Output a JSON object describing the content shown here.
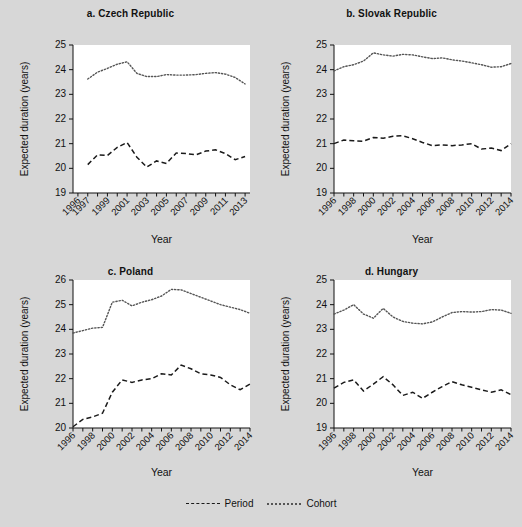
{
  "figure": {
    "background": "#d7d7d7",
    "legend": {
      "position": "bottom-center",
      "items": [
        {
          "label": "Period",
          "style": "dashed",
          "color": "#1a1a1a"
        },
        {
          "label": "Cohort",
          "style": "dotted",
          "color": "#555555"
        }
      ]
    }
  },
  "chart_data": [
    {
      "type": "line",
      "panel": "a",
      "title": "a. Czech Republic",
      "xlabel": "Year",
      "ylabel": "Expected duration (years)",
      "xlim": [
        1995.5,
        2013.5
      ],
      "ylim": [
        19,
        25
      ],
      "yticks": [
        19,
        20,
        21,
        22,
        23,
        24,
        25
      ],
      "xticks": [
        1996,
        1997,
        1999,
        2001,
        2003,
        2005,
        2007,
        2009,
        2011,
        2013
      ],
      "x": [
        1997,
        1998,
        1999,
        2000,
        2001,
        2002,
        2003,
        2004,
        2005,
        2006,
        2007,
        2008,
        2009,
        2010,
        2011,
        2012,
        2013
      ],
      "series": [
        {
          "name": "Period",
          "style": "dashed",
          "values": [
            20.15,
            20.55,
            20.52,
            20.85,
            21.05,
            20.45,
            20.05,
            20.3,
            20.2,
            20.62,
            20.6,
            20.55,
            20.7,
            20.75,
            20.6,
            20.35,
            20.48
          ]
        },
        {
          "name": "Cohort",
          "style": "dotted",
          "values": [
            23.62,
            23.9,
            24.05,
            24.22,
            24.32,
            23.85,
            23.72,
            23.72,
            23.8,
            23.78,
            23.78,
            23.8,
            23.85,
            23.88,
            23.82,
            23.68,
            23.42
          ]
        }
      ],
      "grid": false
    },
    {
      "type": "line",
      "panel": "b",
      "title": "b. Slovak Republic",
      "xlabel": "Year",
      "ylabel": "Expected duration (years)",
      "xlim": [
        1996,
        2014
      ],
      "ylim": [
        19,
        25
      ],
      "yticks": [
        19,
        20,
        21,
        22,
        23,
        24,
        25
      ],
      "xticks": [
        1996,
        1998,
        2000,
        2002,
        2004,
        2006,
        2008,
        2010,
        2012,
        2014
      ],
      "x": [
        1996,
        1997,
        1998,
        1999,
        2000,
        2001,
        2002,
        2003,
        2004,
        2005,
        2006,
        2007,
        2008,
        2009,
        2010,
        2011,
        2012,
        2013,
        2014
      ],
      "series": [
        {
          "name": "Period",
          "style": "dashed",
          "values": [
            21.0,
            21.15,
            21.12,
            21.1,
            21.25,
            21.22,
            21.3,
            21.32,
            21.2,
            21.05,
            20.92,
            20.95,
            20.92,
            20.95,
            21.0,
            20.78,
            20.82,
            20.72,
            21.0
          ]
        },
        {
          "name": "Cohort",
          "style": "dotted",
          "values": [
            23.95,
            24.12,
            24.2,
            24.35,
            24.68,
            24.6,
            24.55,
            24.62,
            24.6,
            24.52,
            24.45,
            24.48,
            24.4,
            24.35,
            24.28,
            24.2,
            24.1,
            24.12,
            24.25
          ]
        }
      ],
      "grid": false
    },
    {
      "type": "line",
      "panel": "c",
      "title": "c. Poland",
      "xlabel": "Year",
      "ylabel": "Expected duration (years)",
      "xlim": [
        1996,
        2014
      ],
      "ylim": [
        20,
        26
      ],
      "yticks": [
        20,
        21,
        22,
        23,
        24,
        25,
        26
      ],
      "xticks": [
        1996,
        1998,
        2000,
        2002,
        2004,
        2006,
        2008,
        2010,
        2012,
        2014
      ],
      "x": [
        1996,
        1997,
        1998,
        1999,
        2000,
        2001,
        2002,
        2003,
        2004,
        2005,
        2006,
        2007,
        2008,
        2009,
        2010,
        2011,
        2012,
        2013,
        2014
      ],
      "series": [
        {
          "name": "Period",
          "style": "dashed",
          "values": [
            20.05,
            20.35,
            20.45,
            20.6,
            21.45,
            21.95,
            21.85,
            21.95,
            22.0,
            22.2,
            22.15,
            22.55,
            22.4,
            22.2,
            22.15,
            22.05,
            21.75,
            21.55,
            21.78
          ]
        },
        {
          "name": "Cohort",
          "style": "dotted",
          "values": [
            23.85,
            23.95,
            24.05,
            24.08,
            25.1,
            25.18,
            24.95,
            25.1,
            25.2,
            25.35,
            25.62,
            25.6,
            25.45,
            25.3,
            25.15,
            25.0,
            24.9,
            24.8,
            24.65
          ]
        }
      ],
      "grid": false
    },
    {
      "type": "line",
      "panel": "d",
      "title": "d. Hungary",
      "xlabel": "Year",
      "ylabel": "Expected duration (years)",
      "xlim": [
        1996,
        2014
      ],
      "ylim": [
        19,
        25
      ],
      "yticks": [
        19,
        20,
        21,
        22,
        23,
        24,
        25
      ],
      "xticks": [
        1996,
        1998,
        2000,
        2002,
        2004,
        2006,
        2008,
        2010,
        2012,
        2014
      ],
      "x": [
        1996,
        1997,
        1998,
        1999,
        2000,
        2001,
        2002,
        2003,
        2004,
        2005,
        2006,
        2007,
        2008,
        2009,
        2010,
        2011,
        2012,
        2013,
        2014
      ],
      "series": [
        {
          "name": "Period",
          "style": "dashed",
          "values": [
            20.62,
            20.85,
            20.95,
            20.5,
            20.78,
            21.08,
            20.75,
            20.32,
            20.45,
            20.2,
            20.45,
            20.68,
            20.88,
            20.75,
            20.65,
            20.55,
            20.45,
            20.55,
            20.35
          ]
        },
        {
          "name": "Cohort",
          "style": "dotted",
          "values": [
            23.62,
            23.78,
            24.0,
            23.62,
            23.45,
            23.85,
            23.5,
            23.32,
            23.25,
            23.22,
            23.3,
            23.5,
            23.68,
            23.72,
            23.7,
            23.72,
            23.8,
            23.78,
            23.65
          ]
        }
      ],
      "grid": false
    }
  ]
}
